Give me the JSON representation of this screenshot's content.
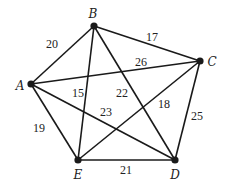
{
  "diagram": {
    "type": "weighted-complete-graph",
    "nodes": [
      {
        "id": "A",
        "label": "A",
        "x": 31,
        "y": 84,
        "lx": 20,
        "ly": 90
      },
      {
        "id": "B",
        "label": "B",
        "x": 94,
        "y": 26,
        "lx": 93,
        "ly": 18
      },
      {
        "id": "C",
        "label": "C",
        "x": 200,
        "y": 61,
        "lx": 212,
        "ly": 66
      },
      {
        "id": "D",
        "label": "D",
        "x": 175,
        "y": 160,
        "lx": 175,
        "ly": 179
      },
      {
        "id": "E",
        "label": "E",
        "x": 78,
        "y": 160,
        "lx": 78,
        "ly": 179
      }
    ],
    "edges": [
      {
        "from": "A",
        "to": "B",
        "weight": "20",
        "wx": 52,
        "wy": 48
      },
      {
        "from": "B",
        "to": "C",
        "weight": "17",
        "wx": 152,
        "wy": 41
      },
      {
        "from": "A",
        "to": "C",
        "weight": "26",
        "wx": 141,
        "wy": 66
      },
      {
        "from": "B",
        "to": "E",
        "weight": "15",
        "wx": 78,
        "wy": 97
      },
      {
        "from": "B",
        "to": "D",
        "weight": "22",
        "wx": 122,
        "wy": 97
      },
      {
        "from": "A",
        "to": "D",
        "weight": "23",
        "wx": 106,
        "wy": 116
      },
      {
        "from": "C",
        "to": "E",
        "weight": "18",
        "wx": 164,
        "wy": 108
      },
      {
        "from": "A",
        "to": "E",
        "weight": "19",
        "wx": 39,
        "wy": 132
      },
      {
        "from": "C",
        "to": "D",
        "weight": "25",
        "wx": 197,
        "wy": 120
      },
      {
        "from": "E",
        "to": "D",
        "weight": "21",
        "wx": 126,
        "wy": 174
      }
    ]
  }
}
